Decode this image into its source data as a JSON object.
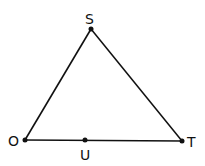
{
  "diagram": {
    "type": "triangle",
    "points": {
      "S": {
        "label": "S",
        "x": 91,
        "y": 29
      },
      "O": {
        "label": "O",
        "x": 25,
        "y": 140
      },
      "T": {
        "label": "T",
        "x": 182,
        "y": 141
      },
      "U": {
        "label": "U",
        "x": 85,
        "y": 140
      }
    },
    "segments": [
      [
        "O",
        "S"
      ],
      [
        "S",
        "T"
      ],
      [
        "O",
        "T"
      ]
    ],
    "line_color": "#111111"
  }
}
